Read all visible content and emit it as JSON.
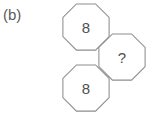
{
  "figure": {
    "label": "(b)",
    "background_color": "#ffffff",
    "stroke_color": "#8d8d8d",
    "text_color": "#4f4f4f",
    "width": 157,
    "height": 114,
    "shape_type": "octagon",
    "cells": [
      {
        "id": "top",
        "name": "octagon-top",
        "value": "8",
        "center_x": 86,
        "center_y": 27,
        "radius": 25
      },
      {
        "id": "right",
        "name": "octagon-right",
        "value": "?",
        "center_x": 122,
        "center_y": 57,
        "radius": 25
      },
      {
        "id": "bottom",
        "name": "octagon-bottom",
        "value": "8",
        "center_x": 86,
        "center_y": 88,
        "radius": 25
      }
    ]
  }
}
